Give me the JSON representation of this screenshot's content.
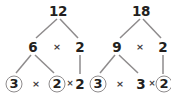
{
  "figure": {
    "type": "factor-tree-pair",
    "colors": {
      "text": "#231f20",
      "operator": "#3f3c3d",
      "edge": "#8e8b8c",
      "circle": "#8e8b8c",
      "background": "#ffffff"
    }
  },
  "trees": [
    {
      "id": "tree-12",
      "root": "12",
      "level2": {
        "left": "6",
        "operator": "×",
        "right": "2"
      },
      "level3": {
        "a": "3",
        "a_circled": true,
        "op1": "×",
        "b": "2",
        "b_circled": true,
        "op2": "×",
        "c": "2",
        "c_circled": false
      }
    },
    {
      "id": "tree-18",
      "root": "18",
      "level2": {
        "left": "9",
        "operator": "×",
        "right": "2"
      },
      "level3": {
        "a": "3",
        "a_circled": true,
        "op1": "×",
        "b": "3",
        "b_circled": false,
        "op2": "×",
        "c": "2",
        "c_circled": true
      }
    }
  ]
}
